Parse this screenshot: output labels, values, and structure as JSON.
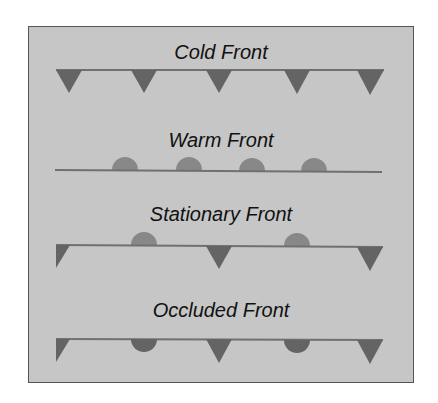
{
  "diagram": {
    "colors": {
      "background": "#c6c6c6",
      "border": "#555555",
      "line": "#707070",
      "triangle": "#646464",
      "semicircle": "#888888",
      "text": "#111111"
    },
    "fronts": [
      {
        "name": "Cold Front",
        "symbols": "triangles below line"
      },
      {
        "name": "Warm Front",
        "symbols": "semicircles above line"
      },
      {
        "name": "Stationary Front",
        "symbols": "alternating triangles below and semicircles above"
      },
      {
        "name": "Occluded Front",
        "symbols": "alternating triangles and semicircles below line"
      }
    ]
  }
}
